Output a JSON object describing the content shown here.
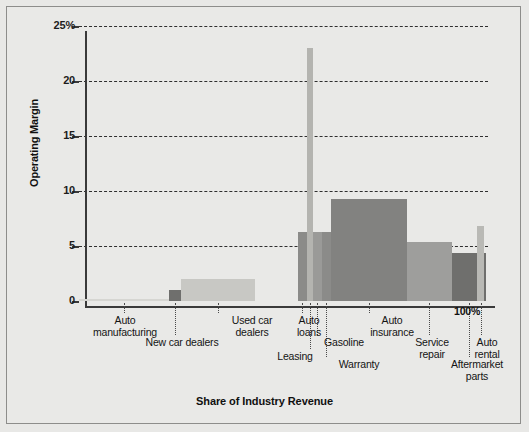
{
  "axes": {
    "y_title": "Operating Margin",
    "x_title": "Share of Industry Revenue",
    "y_ticks": [
      "25%",
      "20",
      "15",
      "10",
      "5",
      "0"
    ],
    "x_end_label": "100%"
  },
  "chart_data": {
    "type": "bar",
    "title": "",
    "xlabel": "Share of Industry Revenue",
    "ylabel": "Operating Margin",
    "ylim": [
      0,
      25
    ],
    "xlim": [
      0,
      100
    ],
    "grid": true,
    "legend": "none",
    "note": "Marimekko chart: bar width = share of industry revenue (%), bar height = operating margin (%)",
    "categories": [
      "Auto manufacturing",
      "New car dealers",
      "Used car dealers",
      "Auto loans",
      "Leasing",
      "Gasoline",
      "Warranty",
      "Auto insurance",
      "Service repair",
      "Aftermarket parts",
      "Auto rental"
    ],
    "values": [
      0.1,
      1.0,
      2.0,
      6.3,
      23.0,
      6.3,
      6.3,
      9.3,
      5.4,
      4.4,
      6.8
    ],
    "widths": [
      22.0,
      3.0,
      18.0,
      2.2,
      1.5,
      2.2,
      2.2,
      18.5,
      11.0,
      8.5,
      1.6
    ],
    "colors": [
      "#d6d6d2",
      "#6f6f6d",
      "#c8c8c4",
      "#8b8b89",
      "#b4b4b0",
      "#9a9a98",
      "#8b8b89",
      "#828280",
      "#9e9e9c",
      "#6f6f6d",
      "#b9b9b5"
    ]
  },
  "bars": [
    {
      "name": "auto-manufacturing",
      "label": "Auto\nmanufacturing",
      "x": 0.0,
      "w": 22.0,
      "h": 0.1,
      "color": "#d6d6d2"
    },
    {
      "name": "new-car-dealers",
      "label": "New car dealers",
      "x": 22.0,
      "w": 3.0,
      "h": 1.0,
      "color": "#6f6f6d"
    },
    {
      "name": "used-car-dealers",
      "label": "Used car\ndealers",
      "x": 25.0,
      "w": 18.0,
      "h": 2.0,
      "color": "#c8c8c4"
    },
    {
      "name": "auto-loans",
      "label": "Auto\nloans",
      "x": 53.5,
      "w": 2.2,
      "h": 6.3,
      "color": "#8b8b89"
    },
    {
      "name": "leasing",
      "label": "Leasing",
      "x": 55.7,
      "w": 1.5,
      "h": 23.0,
      "color": "#b4b4b0"
    },
    {
      "name": "gasoline",
      "label": "Gasoline",
      "x": 57.2,
      "w": 2.2,
      "h": 6.3,
      "color": "#9a9a98"
    },
    {
      "name": "warranty",
      "label": "Warranty",
      "x": 59.4,
      "w": 2.2,
      "h": 6.3,
      "color": "#8b8b89"
    },
    {
      "name": "auto-insurance",
      "label": "Auto\ninsurance",
      "x": 61.6,
      "w": 18.5,
      "h": 9.3,
      "color": "#828280"
    },
    {
      "name": "service-repair",
      "label": "Service\nrepair",
      "x": 80.1,
      "w": 11.0,
      "h": 5.4,
      "color": "#9e9e9c"
    },
    {
      "name": "aftermarket-parts",
      "label": "Aftermarket\nparts",
      "x": 91.1,
      "w": 8.5,
      "h": 4.4,
      "color": "#6f6f6d"
    },
    {
      "name": "auto-rental",
      "label": "Auto\nrental",
      "x": 97.4,
      "w": 1.6,
      "h": 6.8,
      "color": "#b9b9b5"
    }
  ]
}
